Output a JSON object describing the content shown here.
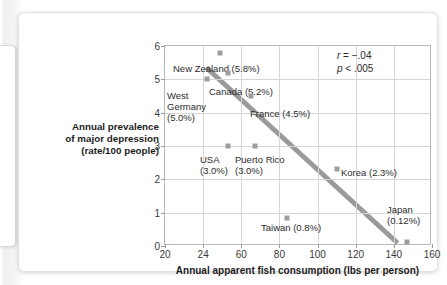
{
  "chart_data": {
    "type": "scatter",
    "title": "",
    "xlabel": "Annual apparent fish consumption (lbs per person)",
    "ylabel": "Annual prevalence\nof major depression\n(rate/100 people)",
    "ylabel_lines": [
      "Annual prevalence",
      "of major depression",
      "(rate/100 people)"
    ],
    "xlim": [
      20,
      160
    ],
    "ylim": [
      0,
      6
    ],
    "xticks": [
      20,
      24,
      60,
      80,
      100,
      120,
      140,
      160
    ],
    "xtick_labels": [
      "20",
      "24",
      "60",
      "80",
      "100",
      "120",
      "140",
      "160"
    ],
    "yticks": [
      0,
      1,
      2,
      3,
      4,
      5,
      6
    ],
    "ytick_labels": [
      "0",
      "1",
      "2",
      "3",
      "4",
      "5",
      "6"
    ],
    "grid": true,
    "legend": "none",
    "marker_color": "#9d9d9d",
    "trendline_color": "#9a9a9a",
    "points": [
      {
        "name": "New Zealand",
        "x": 40,
        "y": 5.8,
        "label": "New Zealand (5.8%)",
        "label_x": 8,
        "label_y": 17
      },
      {
        "name": "West Germany",
        "x": 28,
        "y": 5.0,
        "label": "West\nGermany\n(5.0%)",
        "label_x": 2,
        "label_y": 44
      },
      {
        "name": "Canada",
        "x": 47,
        "y": 5.2,
        "label": "Canada (5.2%)",
        "label_x": 44,
        "label_y": 40
      },
      {
        "name": "France",
        "x": 65,
        "y": 4.5,
        "label": "France (4.5%)",
        "label_x": 85,
        "label_y": 62
      },
      {
        "name": "USA",
        "x": 47,
        "y": 3.0,
        "label": "USA\n(3.0%)",
        "label_x": 35,
        "label_y": 108
      },
      {
        "name": "Puerto Rico",
        "x": 67,
        "y": 3.0,
        "label": "Puerto Rico\n(3.0%)",
        "label_x": 70,
        "label_y": 108
      },
      {
        "name": "Korea",
        "x": 110,
        "y": 2.3,
        "label": "Korea (2.3%)",
        "label_x": 176,
        "label_y": 121
      },
      {
        "name": "Taiwan",
        "x": 84,
        "y": 0.83,
        "label": "Taiwan (0.8%)",
        "label_x": 96,
        "label_y": 176
      },
      {
        "name": "Japan",
        "x": 147,
        "y": 0.12,
        "label": "Japan\n(0.12%)",
        "label_x": 222,
        "label_y": 158
      }
    ],
    "trendline": {
      "x1": 27,
      "y1": 5.35,
      "x2": 143,
      "y2": 0.03
    },
    "annotations": [
      {
        "id": "correlation",
        "text_lead": "r",
        "text_rest": " = −.04"
      },
      {
        "id": "pvalue",
        "text_lead": "p",
        "text_rest": " < .005"
      }
    ]
  }
}
